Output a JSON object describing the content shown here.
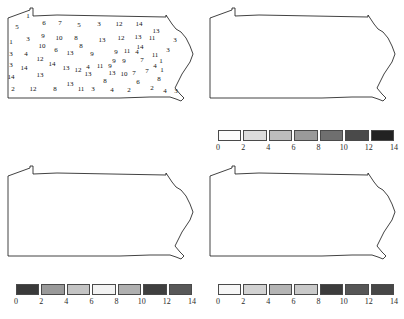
{
  "figure": {
    "title": "",
    "background": "#ffffff",
    "panel_count": 4
  },
  "chart_data": {
    "type": "heatmap",
    "title": "",
    "subtitle": "",
    "xlabel": "",
    "ylabel": "",
    "legend_position": "below-map",
    "grid": false,
    "classes": 7,
    "class_breaks": [
      0,
      2,
      4,
      6,
      8,
      10,
      12,
      14
    ],
    "tick_labels": [
      "0",
      "2",
      "4",
      "6",
      "8",
      "10",
      "12",
      "14"
    ],
    "panels": [
      {
        "id": "reference",
        "position": "top-left",
        "kind": "labelled-reference-map",
        "has_legend": false,
        "fill": "#ffffff",
        "label_range": [
          1,
          14
        ]
      },
      {
        "id": "map-2",
        "position": "top-right",
        "kind": "choropleth",
        "has_legend": true,
        "legend_colors": [
          "#fbfbfb",
          "#dcdcdc",
          "#bdbdbd",
          "#9a9a9a",
          "#6f6f6f",
          "#4a4a4a",
          "#222222"
        ]
      },
      {
        "id": "map-3",
        "position": "bottom-left",
        "kind": "choropleth",
        "has_legend": true,
        "legend_colors": [
          "#3a3a3a",
          "#9a9a9a",
          "#c4c4c4",
          "#f2f2f2",
          "#b0b0b0",
          "#3f3f3f",
          "#585858"
        ]
      },
      {
        "id": "map-4",
        "position": "bottom-right",
        "kind": "choropleth",
        "has_legend": true,
        "legend_colors": [
          "#f6f6f6",
          "#d2d2d2",
          "#b4b4b4",
          "#c9c9c9",
          "#3c3c3c",
          "#565656",
          "#474747"
        ]
      }
    ],
    "counties": [
      {
        "n": 1,
        "x": 28,
        "y": 14
      },
      {
        "n": 5,
        "x": 17,
        "y": 25
      },
      {
        "n": 6,
        "x": 44,
        "y": 21
      },
      {
        "n": 7,
        "x": 60,
        "y": 21
      },
      {
        "n": 5,
        "x": 79,
        "y": 23
      },
      {
        "n": 3,
        "x": 99,
        "y": 22
      },
      {
        "n": 12,
        "x": 119,
        "y": 22
      },
      {
        "n": 14,
        "x": 139,
        "y": 22
      },
      {
        "n": 13,
        "x": 156,
        "y": 29
      },
      {
        "n": 1,
        "x": 11,
        "y": 40
      },
      {
        "n": 3,
        "x": 28,
        "y": 37
      },
      {
        "n": 9,
        "x": 43,
        "y": 34
      },
      {
        "n": 10,
        "x": 59,
        "y": 36
      },
      {
        "n": 8,
        "x": 76,
        "y": 36
      },
      {
        "n": 13,
        "x": 102,
        "y": 38
      },
      {
        "n": 12,
        "x": 121,
        "y": 36
      },
      {
        "n": 13,
        "x": 138,
        "y": 35
      },
      {
        "n": 11,
        "x": 152,
        "y": 36
      },
      {
        "n": 3,
        "x": 175,
        "y": 38
      },
      {
        "n": 10,
        "x": 42,
        "y": 44
      },
      {
        "n": 6,
        "x": 56,
        "y": 48
      },
      {
        "n": 8,
        "x": 81,
        "y": 44
      },
      {
        "n": 14,
        "x": 140,
        "y": 45
      },
      {
        "n": 3,
        "x": 168,
        "y": 48
      },
      {
        "n": 3,
        "x": 11,
        "y": 52
      },
      {
        "n": 4,
        "x": 26,
        "y": 52
      },
      {
        "n": 13,
        "x": 70,
        "y": 51
      },
      {
        "n": 9,
        "x": 92,
        "y": 52
      },
      {
        "n": 9,
        "x": 116,
        "y": 50
      },
      {
        "n": 11,
        "x": 127,
        "y": 49
      },
      {
        "n": 4,
        "x": 137,
        "y": 50
      },
      {
        "n": 11,
        "x": 155,
        "y": 53
      },
      {
        "n": 12,
        "x": 40,
        "y": 57
      },
      {
        "n": 3,
        "x": 11,
        "y": 63
      },
      {
        "n": 14,
        "x": 24,
        "y": 66
      },
      {
        "n": 14,
        "x": 52,
        "y": 62
      },
      {
        "n": 9,
        "x": 114,
        "y": 59
      },
      {
        "n": 9,
        "x": 124,
        "y": 59
      },
      {
        "n": 7,
        "x": 142,
        "y": 58
      },
      {
        "n": 1,
        "x": 161,
        "y": 59
      },
      {
        "n": 13,
        "x": 66,
        "y": 66
      },
      {
        "n": 12,
        "x": 78,
        "y": 68
      },
      {
        "n": 4,
        "x": 88,
        "y": 65
      },
      {
        "n": 11,
        "x": 100,
        "y": 64
      },
      {
        "n": 9,
        "x": 110,
        "y": 64
      },
      {
        "n": 4,
        "x": 155,
        "y": 64
      },
      {
        "n": 13,
        "x": 40,
        "y": 73
      },
      {
        "n": 14,
        "x": 11,
        "y": 75
      },
      {
        "n": 13,
        "x": 88,
        "y": 72
      },
      {
        "n": 13,
        "x": 112,
        "y": 71
      },
      {
        "n": 10,
        "x": 124,
        "y": 72
      },
      {
        "n": 7,
        "x": 134,
        "y": 71
      },
      {
        "n": 7,
        "x": 147,
        "y": 69
      },
      {
        "n": 1,
        "x": 162,
        "y": 68
      },
      {
        "n": 8,
        "x": 159,
        "y": 77
      },
      {
        "n": 8,
        "x": 105,
        "y": 79
      },
      {
        "n": 6,
        "x": 138,
        "y": 80
      },
      {
        "n": 13,
        "x": 70,
        "y": 82
      },
      {
        "n": 2,
        "x": 13,
        "y": 87
      },
      {
        "n": 12,
        "x": 33,
        "y": 87
      },
      {
        "n": 8,
        "x": 55,
        "y": 87
      },
      {
        "n": 11,
        "x": 81,
        "y": 87
      },
      {
        "n": 3,
        "x": 93,
        "y": 87
      },
      {
        "n": 4,
        "x": 112,
        "y": 88
      },
      {
        "n": 2,
        "x": 129,
        "y": 88
      },
      {
        "n": 2,
        "x": 152,
        "y": 86
      },
      {
        "n": 4,
        "x": 165,
        "y": 89
      },
      {
        "n": 3,
        "x": 176,
        "y": 89
      }
    ]
  },
  "legends": {
    "tr": {
      "ticks": [
        "0",
        "2",
        "4",
        "6",
        "8",
        "10",
        "12",
        "14"
      ],
      "colors": [
        "#fbfbfb",
        "#dcdcdc",
        "#bdbdbd",
        "#9a9a9a",
        "#6f6f6f",
        "#4a4a4a",
        "#222222"
      ]
    },
    "bl": {
      "ticks": [
        "0",
        "2",
        "4",
        "6",
        "8",
        "10",
        "12",
        "14"
      ],
      "colors": [
        "#3a3a3a",
        "#9a9a9a",
        "#c4c4c4",
        "#f2f2f2",
        "#b0b0b0",
        "#3f3f3f",
        "#585858"
      ]
    },
    "br": {
      "ticks": [
        "0",
        "2",
        "4",
        "6",
        "8",
        "10",
        "12",
        "14"
      ],
      "colors": [
        "#f6f6f6",
        "#d2d2d2",
        "#b4b4b4",
        "#c9c9c9",
        "#3c3c3c",
        "#565656",
        "#474747"
      ]
    }
  }
}
